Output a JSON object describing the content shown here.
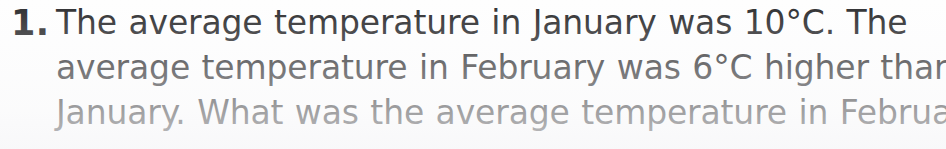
{
  "page": {
    "background_color": "#fefefe",
    "ink_color": "#2c2c2e"
  },
  "question": {
    "number_label": "1.",
    "full_text": "The average temperature in January was 10°C. The average temperature in February was 6°C higher than in January. What was the average temperature in February?",
    "lines": [
      "The average temperature in January was 10°C. The",
      "average temperature in February was 6°C higher than in",
      "January. What was the average temperature in February?"
    ],
    "values": {
      "january_temperature": "10°C",
      "february_increase": "6°C",
      "months": [
        "January",
        "February"
      ]
    }
  }
}
